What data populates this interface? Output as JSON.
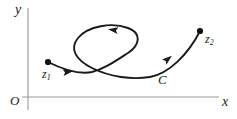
{
  "figure": {
    "background_color": "#ffffff",
    "curve_color": "#1a1a1a",
    "axis_color": "#9a9a9a",
    "axes": {
      "y_label": "y",
      "x_label": "x",
      "origin_label": "O",
      "x_axis": {
        "x1": 28,
        "y1": 97,
        "x2": 219,
        "y2": 97
      },
      "y_axis": {
        "x1": 28,
        "y1": 8,
        "x2": 28,
        "y2": 110
      }
    },
    "labels": {
      "start_point": "z",
      "start_point_sub": "1",
      "end_point": "z",
      "end_point_sub": "2",
      "curve_name": "C"
    },
    "points": [
      {
        "name": "z1",
        "x": 48,
        "y": 62,
        "role": "start-endpoint"
      },
      {
        "name": "z2",
        "x": 200,
        "y": 31,
        "role": "end-endpoint"
      },
      {
        "name": "self-intersection",
        "x": 98,
        "y": 68,
        "role": "crossing"
      }
    ],
    "arrows": [
      {
        "name": "arrow-lower-left",
        "x": 68,
        "y": 72,
        "angle": -8,
        "direction": "right"
      },
      {
        "name": "arrow-loop-top",
        "x": 113,
        "y": 30,
        "angle": 188,
        "direction": "left"
      },
      {
        "name": "arrow-ascending",
        "x": 168,
        "y": 59,
        "angle": -40,
        "direction": "up-right"
      }
    ],
    "curve_path": "M 48 62 C 60 68, 78 75, 92 72 C 104 69, 114 62, 128 53 C 140 45, 142 33, 128 28 C 112 22, 88 26, 78 38 C 69 49, 76 60, 92 68 C 110 77, 132 80, 150 77 C 168 74, 188 55, 200 31"
  }
}
